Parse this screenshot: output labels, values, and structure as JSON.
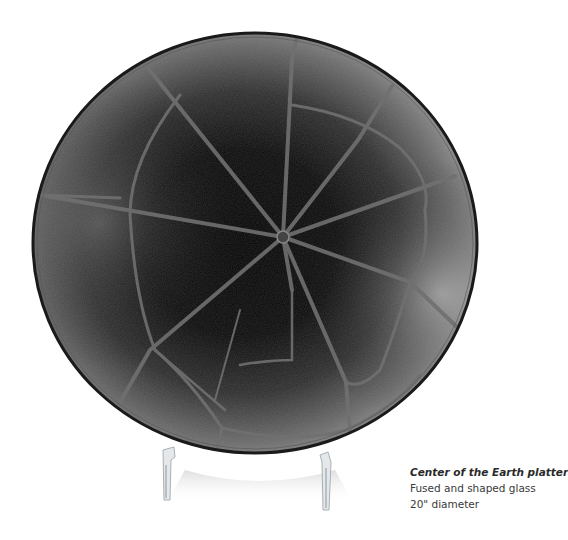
{
  "artwork": {
    "subject": "fused glass platter on acrylic stand",
    "colors": {
      "background": "#ffffff",
      "glass_dark": "#0b0b0b",
      "glass_mid": "#3c3c3c",
      "glass_light": "#9a9a9a",
      "seam": "#6e6e6e",
      "rim": "#1a1a1a",
      "stand": "#d8dde0"
    }
  },
  "caption": {
    "title": "Center of the Earth platter",
    "material": "Fused and shaped glass",
    "size": "20\" diameter"
  }
}
